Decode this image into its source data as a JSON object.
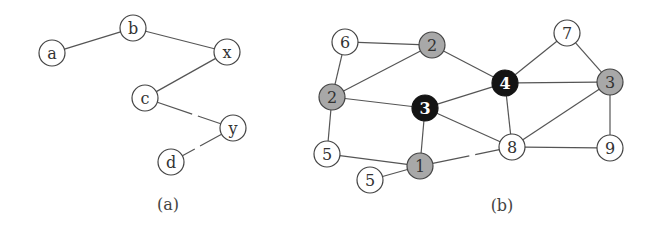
{
  "figure": {
    "panels": [
      {
        "id": "a",
        "caption": "(a)",
        "caption_pos": [
          168,
          204
        ],
        "nodes": [
          {
            "id": "a",
            "label": "a",
            "x": 52,
            "y": 53,
            "fill": "white"
          },
          {
            "id": "b",
            "label": "b",
            "x": 133,
            "y": 28,
            "fill": "white"
          },
          {
            "id": "x",
            "label": "x",
            "x": 227,
            "y": 52,
            "fill": "white"
          },
          {
            "id": "c",
            "label": "c",
            "x": 145,
            "y": 98,
            "fill": "white"
          },
          {
            "id": "y",
            "label": "y",
            "x": 233,
            "y": 128,
            "fill": "white"
          },
          {
            "id": "d",
            "label": "d",
            "x": 171,
            "y": 162,
            "fill": "white"
          }
        ],
        "edges": [
          {
            "from": "a",
            "to": "b",
            "style": "solid"
          },
          {
            "from": "b",
            "to": "x",
            "style": "solid"
          },
          {
            "from": "x",
            "to": "c",
            "style": "solid"
          },
          {
            "from": "c",
            "to": "y",
            "style": "broken"
          },
          {
            "from": "y",
            "to": "d",
            "style": "broken"
          }
        ]
      },
      {
        "id": "b",
        "caption": "(b)",
        "caption_pos": [
          502,
          205
        ],
        "nodes": [
          {
            "id": "n6",
            "label": "6",
            "x": 345,
            "y": 42,
            "fill": "white"
          },
          {
            "id": "n2top",
            "label": "2",
            "x": 432,
            "y": 45,
            "fill": "gray"
          },
          {
            "id": "n2left",
            "label": "2",
            "x": 332,
            "y": 97,
            "fill": "gray"
          },
          {
            "id": "n3black",
            "label": "3",
            "x": 425,
            "y": 108,
            "fill": "black"
          },
          {
            "id": "n4black",
            "label": "4",
            "x": 505,
            "y": 83,
            "fill": "black"
          },
          {
            "id": "n7",
            "label": "7",
            "x": 567,
            "y": 33,
            "fill": "white"
          },
          {
            "id": "n3gray",
            "label": "3",
            "x": 610,
            "y": 82,
            "fill": "gray"
          },
          {
            "id": "n8",
            "label": "8",
            "x": 512,
            "y": 147,
            "fill": "white"
          },
          {
            "id": "n9",
            "label": "9",
            "x": 610,
            "y": 148,
            "fill": "white"
          },
          {
            "id": "n5left",
            "label": "5",
            "x": 327,
            "y": 154,
            "fill": "white"
          },
          {
            "id": "n1",
            "label": "1",
            "x": 420,
            "y": 166,
            "fill": "gray"
          },
          {
            "id": "n5low",
            "label": "5",
            "x": 370,
            "y": 180,
            "fill": "white"
          }
        ],
        "edges": [
          {
            "from": "n6",
            "to": "n2top",
            "style": "solid"
          },
          {
            "from": "n6",
            "to": "n2left",
            "style": "solid"
          },
          {
            "from": "n2left",
            "to": "n2top",
            "style": "solid"
          },
          {
            "from": "n2top",
            "to": "n4black",
            "style": "solid"
          },
          {
            "from": "n2left",
            "to": "n3black",
            "style": "solid"
          },
          {
            "from": "n2left",
            "to": "n5left",
            "style": "solid"
          },
          {
            "from": "n3black",
            "to": "n4black",
            "style": "solid"
          },
          {
            "from": "n3black",
            "to": "n8",
            "style": "solid"
          },
          {
            "from": "n3black",
            "to": "n1",
            "style": "solid"
          },
          {
            "from": "n4black",
            "to": "n7",
            "style": "solid"
          },
          {
            "from": "n4black",
            "to": "n3gray",
            "style": "solid"
          },
          {
            "from": "n4black",
            "to": "n8",
            "style": "solid"
          },
          {
            "from": "n7",
            "to": "n3gray",
            "style": "solid"
          },
          {
            "from": "n3gray",
            "to": "n8",
            "style": "solid"
          },
          {
            "from": "n3gray",
            "to": "n9",
            "style": "solid"
          },
          {
            "from": "n8",
            "to": "n9",
            "style": "solid"
          },
          {
            "from": "n5left",
            "to": "n1",
            "style": "solid"
          },
          {
            "from": "n5low",
            "to": "n1",
            "style": "solid"
          },
          {
            "from": "n1",
            "to": "n8",
            "style": "broken"
          }
        ]
      }
    ],
    "node_radius": 13,
    "colors": {
      "white": "#ffffff",
      "gray": "#a8a8a8",
      "black": "#141414",
      "stroke": "#444444",
      "edge": "#555555"
    }
  }
}
